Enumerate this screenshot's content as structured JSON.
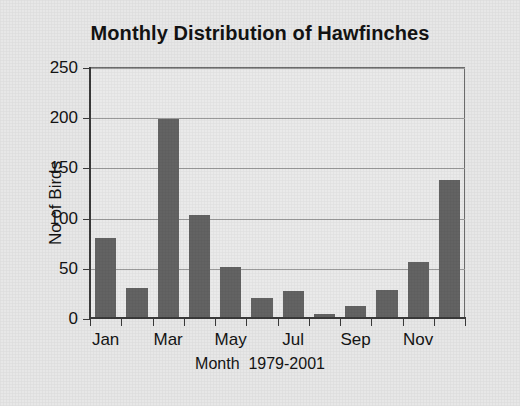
{
  "chart_data": {
    "type": "bar",
    "title": "Monthly Distribution of Hawfinches",
    "xlabel": "Month  1979-2001",
    "ylabel": "No of Birds",
    "categories": [
      "Jan",
      "Feb",
      "Mar",
      "Apr",
      "May",
      "Jun",
      "Jul",
      "Aug",
      "Sep",
      "Oct",
      "Nov",
      "Dec"
    ],
    "values": [
      80,
      30,
      198,
      103,
      51,
      20,
      27,
      4,
      12,
      28,
      56,
      137
    ],
    "visible_x_tick_labels": [
      "Jan",
      "Mar",
      "May",
      "Jul",
      "Sep",
      "Nov"
    ],
    "ylim": [
      0,
      250
    ],
    "yticks": [
      0,
      50,
      100,
      150,
      200,
      250
    ],
    "ytick_labels": [
      "0",
      "50",
      "100",
      "150",
      "200",
      "250"
    ],
    "grid": "horizontal",
    "legend": "none",
    "bar_color": "#636363",
    "background_color": "#e7e7e7",
    "plot_background_color": "#eaeaea",
    "axis_color": "#3a3a3a",
    "gridline_color": "#9a9a9a",
    "text_color": "#141414"
  }
}
